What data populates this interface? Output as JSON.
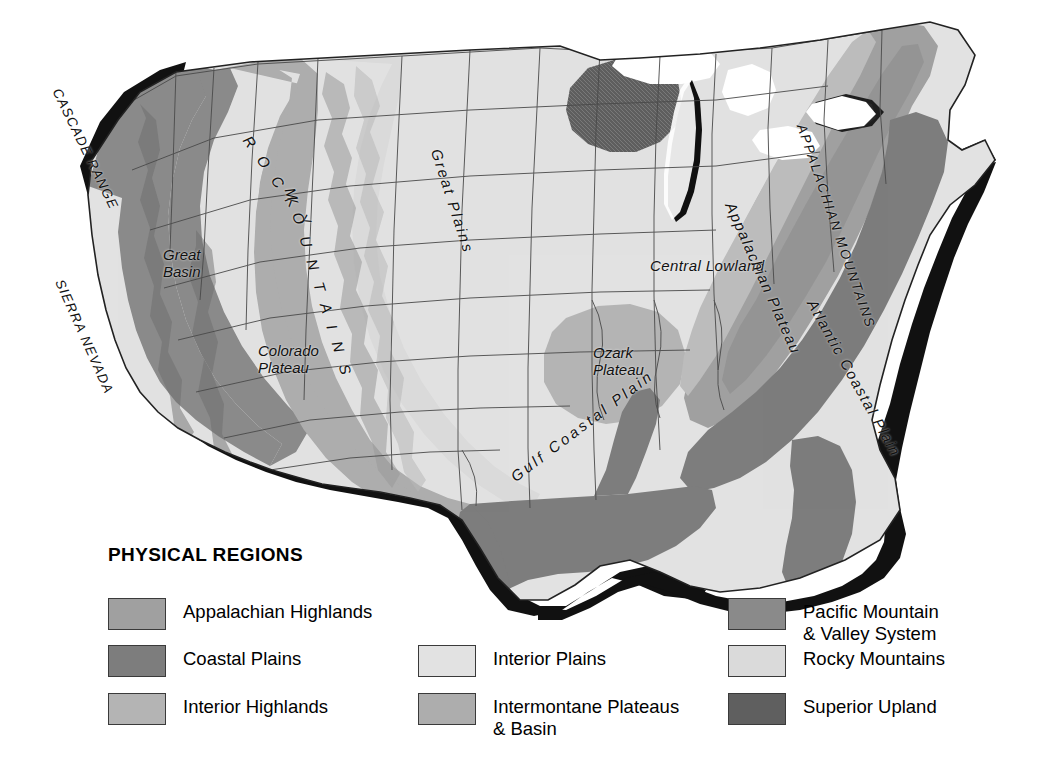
{
  "figure": {
    "kind": "thematic-map",
    "background_color": "#ffffff"
  },
  "map": {
    "name": "united-states-physical-regions-map",
    "ocean_shadow_color": "#111111",
    "border_color": "#2b2b2b",
    "labels": [
      {
        "id": "cascade-range",
        "text": "CASCADE RANGE",
        "style": "caps",
        "x": 63,
        "y": 86,
        "rotate": 64,
        "letter_spacing": "1.2px"
      },
      {
        "id": "sierra-nevada",
        "text": "SIERRA NEVADA",
        "style": "caps",
        "x": 66,
        "y": 277,
        "rotate": 66,
        "letter_spacing": "1.2px"
      },
      {
        "id": "rocky-mountains",
        "text": "R O C K Y",
        "style": "spaced",
        "x": 253,
        "y": 133,
        "rotate": 55,
        "letter_spacing": "4.5px"
      },
      {
        "id": "rocky-mountains-2",
        "text": "M O U N T A I N S",
        "style": "spaced",
        "x": 297,
        "y": 186,
        "rotate": 73,
        "letter_spacing": "4.5px"
      },
      {
        "id": "great-basin",
        "text": "Great\nBasin",
        "style": "plain",
        "x": 163,
        "y": 247,
        "rotate": 0,
        "letter_spacing": "0"
      },
      {
        "id": "colorado-plateau",
        "text": "Colorado\nPlateau",
        "style": "plain",
        "x": 258,
        "y": 343,
        "rotate": 0,
        "letter_spacing": "0"
      },
      {
        "id": "great-plains",
        "text": "Great Plains",
        "style": "wide",
        "x": 443,
        "y": 147,
        "rotate": 72,
        "letter_spacing": "2.2px"
      },
      {
        "id": "central-lowland",
        "text": "Central Lowland",
        "style": "tight",
        "x": 650,
        "y": 258,
        "rotate": 0,
        "letter_spacing": ".4px"
      },
      {
        "id": "ozark-plateau",
        "text": "Ozark\nPlateau",
        "style": "plain",
        "x": 593,
        "y": 345,
        "rotate": 0,
        "letter_spacing": "0"
      },
      {
        "id": "superior-upland-area",
        "text": "",
        "style": "plain",
        "x": 0,
        "y": 0,
        "rotate": 0,
        "letter_spacing": "0"
      },
      {
        "id": "appalachian-plateau",
        "text": "Appalachian Plateau",
        "style": "wide",
        "x": 737,
        "y": 200,
        "rotate": 66,
        "letter_spacing": "1.4px"
      },
      {
        "id": "appalachian-mountains",
        "text": "APPALACHIAN MOUNTAINS",
        "style": "caps",
        "x": 808,
        "y": 122,
        "rotate": 71,
        "letter_spacing": "1.8px"
      },
      {
        "id": "atlantic-coastal-plain",
        "text": "Atlantic Coastal Plain",
        "style": "wide",
        "x": 818,
        "y": 297,
        "rotate": 61,
        "letter_spacing": "1.6px"
      },
      {
        "id": "gulf-coastal-plain",
        "text": "Gulf Coastal Plain",
        "style": "spaced",
        "x": 508,
        "y": 472,
        "rotate": -37,
        "letter_spacing": "3px"
      }
    ]
  },
  "legend": {
    "title": "PHYSICAL REGIONS",
    "columns": [
      {
        "id": "legend-column-left",
        "x": 108,
        "items": [
          {
            "id": "appalachian-highlands",
            "label": "Appalachian Highlands",
            "color": "#a0a0a0",
            "y": 598,
            "textured": false
          },
          {
            "id": "coastal-plains",
            "label": "Coastal Plains",
            "color": "#7d7d7d",
            "y": 645,
            "textured": false
          },
          {
            "id": "interior-highlands",
            "label": "Interior Highlands",
            "color": "#b4b4b4",
            "y": 693,
            "textured": false
          }
        ]
      },
      {
        "id": "legend-column-middle",
        "x": 418,
        "items": [
          {
            "id": "interior-plains",
            "label": "Interior Plains",
            "color": "#e2e2e2",
            "y": 645,
            "textured": false
          },
          {
            "id": "intermontane-plateaus",
            "label": "Intermontane Plateaus\n& Basin",
            "color": "#adadad",
            "y": 693,
            "textured": false
          }
        ]
      },
      {
        "id": "legend-column-right",
        "x": 728,
        "items": [
          {
            "id": "pacific-mountain-valley",
            "label": "Pacific Mountain\n& Valley System",
            "color": "#8a8a8a",
            "y": 598,
            "textured": false
          },
          {
            "id": "rocky-mountains",
            "label": "Rocky Mountains",
            "color": "#dadada",
            "y": 645,
            "textured": false
          },
          {
            "id": "superior-upland",
            "label": "Superior Upland",
            "color": "#5f5f5f",
            "y": 693,
            "textured": true
          }
        ]
      }
    ]
  },
  "palette": {
    "appalachian_highlands": "#a0a0a0",
    "coastal_plains": "#7d7d7d",
    "interior_highlands": "#b4b4b4",
    "interior_plains": "#e2e2e2",
    "intermontane_plateaus": "#adadad",
    "pacific_mountain_valley": "#8a8a8a",
    "rocky_mountains": "#dadada",
    "superior_upland": "#5f5f5f",
    "lakes": "#ffffff",
    "lake_michigan_shadow": "#111111",
    "ocean_shadow": "#111111",
    "state_border": "#4a4a4a",
    "national_border": "#222222"
  }
}
